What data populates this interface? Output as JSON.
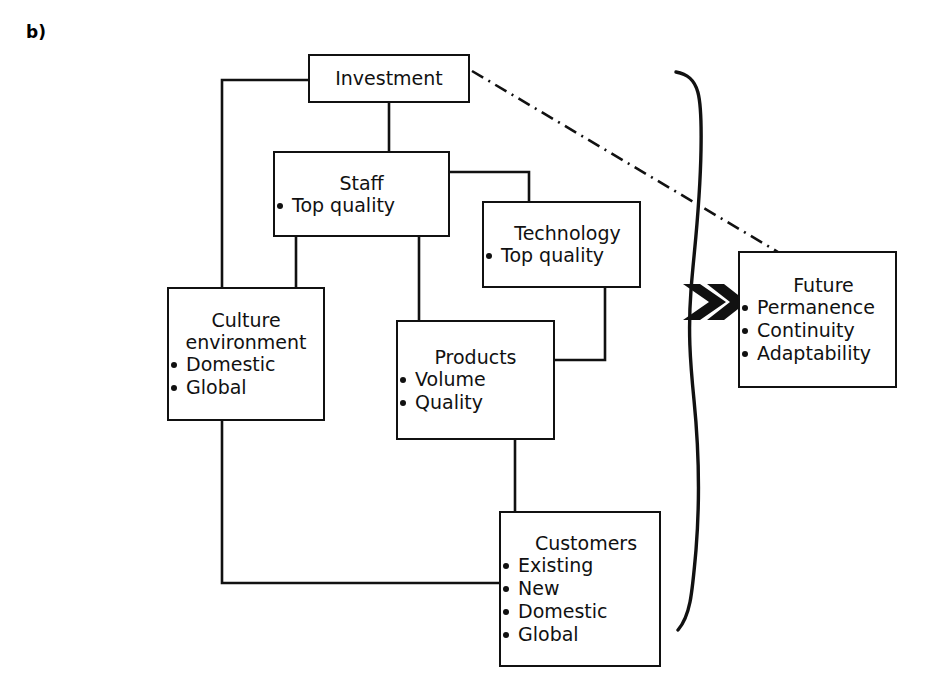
{
  "figure": {
    "panel_label": "b)",
    "type": "block-flow-diagram",
    "ink_color": "#111111",
    "background_color": "#ffffff"
  },
  "nodes": {
    "investment": {
      "title": "Investment",
      "bullets": []
    },
    "staff": {
      "title": "Staff",
      "bullets": [
        "Top quality"
      ]
    },
    "technology": {
      "title": "Technology",
      "bullets": [
        "Top quality"
      ]
    },
    "culture": {
      "title": "Culture\nenvironment",
      "bullets": [
        "Domestic",
        "Global"
      ]
    },
    "products": {
      "title": "Products",
      "bullets": [
        "Volume",
        "Quality"
      ]
    },
    "customers": {
      "title": "Customers",
      "bullets": [
        "Existing",
        "New",
        "Domestic",
        "Global"
      ]
    },
    "future": {
      "title": "Future",
      "bullets": [
        "Permanence",
        "Continuity",
        "Adaptability"
      ]
    }
  },
  "connectors": {
    "investment_to_culture": "orthogonal",
    "investment_to_staff": "vertical",
    "staff_to_technology": "orthogonal",
    "staff_to_culture": "orthogonal",
    "staff_to_products": "vertical",
    "technology_to_products": "orthogonal",
    "products_to_customers": "orthogonal",
    "culture_to_customers": "orthogonal",
    "investment_to_future": "dash-dot",
    "brace_to_future": "arrow-double-chevron"
  }
}
